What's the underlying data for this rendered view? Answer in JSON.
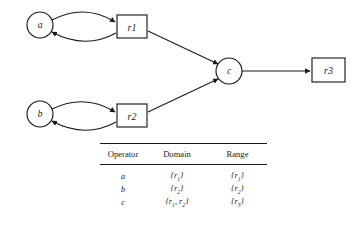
{
  "figure": {
    "type": "operator-dependency-diagram",
    "nodes": [
      {
        "id": "a",
        "label": "a",
        "shape": "circle",
        "cx": 40,
        "cy": 25,
        "r": 13
      },
      {
        "id": "b",
        "label": "b",
        "shape": "circle",
        "cx": 40,
        "cy": 114,
        "r": 13
      },
      {
        "id": "c",
        "label": "c",
        "shape": "circle",
        "cx": 229,
        "cy": 71,
        "r": 13
      },
      {
        "id": "r1",
        "label": "r1",
        "shape": "box",
        "x": 117,
        "y": 15,
        "w": 30,
        "h": 23
      },
      {
        "id": "r2",
        "label": "r2",
        "shape": "box",
        "x": 117,
        "y": 104,
        "w": 30,
        "h": 23
      },
      {
        "id": "r3",
        "label": "r3",
        "shape": "box",
        "x": 312,
        "y": 58,
        "w": 33,
        "h": 24
      }
    ],
    "edges": [
      {
        "from": "a",
        "to": "r1",
        "style": "curved"
      },
      {
        "from": "r1",
        "to": "a",
        "style": "curved"
      },
      {
        "from": "b",
        "to": "r2",
        "style": "curved"
      },
      {
        "from": "r2",
        "to": "b",
        "style": "curved"
      },
      {
        "from": "r1",
        "to": "c",
        "style": "straight"
      },
      {
        "from": "r2",
        "to": "c",
        "style": "straight"
      },
      {
        "from": "c",
        "to": "r3",
        "style": "straight"
      }
    ],
    "stroke_color": "#1a1a1a",
    "fill_color": "#ffffff"
  },
  "table": {
    "headers": [
      "Operator",
      "Domain",
      "Range"
    ],
    "rows": [
      {
        "operator": "a",
        "domain_open": "{",
        "domain": "r",
        "domain_sub": "1",
        "domain_close": "}",
        "range_open": "{",
        "range": "r",
        "range_sub": "1",
        "range_close": "}"
      },
      {
        "operator": "b",
        "domain_open": "{",
        "domain": "r",
        "domain_sub": "2",
        "domain_close": "}",
        "range_open": "{",
        "range": "r",
        "range_sub": "2",
        "range_close": "}"
      },
      {
        "operator": "c",
        "domain_open": "{",
        "domain": "r",
        "domain_sub": "1",
        "domain_close": "}",
        "range_open": "{",
        "range": "r",
        "range_sub": "3",
        "range_close": "}"
      }
    ],
    "row_c_domain_full_a": "r",
    "row_c_domain_full_a_sub": "1",
    "row_c_domain_sep": ", ",
    "row_c_domain_full_b": "r",
    "row_c_domain_full_b_sub": "2"
  }
}
